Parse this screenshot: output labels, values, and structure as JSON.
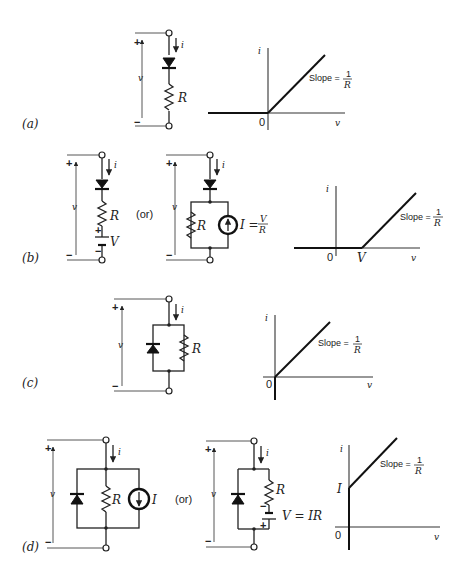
{
  "figure": {
    "panels": [
      {
        "id": "a",
        "label": "(a)",
        "circuit": {
          "current": "i",
          "voltage": "v",
          "plus": "+",
          "minus": "−",
          "resistor": "R"
        },
        "graph": {
          "y_axis": "i",
          "x_axis": "v",
          "origin": "0",
          "slope_text": "Slope =",
          "slope_num": "1",
          "slope_den": "R"
        }
      },
      {
        "id": "b",
        "label": "(b)",
        "circuit1": {
          "current": "i",
          "voltage": "v",
          "plus": "+",
          "minus": "−",
          "resistor": "R",
          "battery": "V",
          "bat_plus": "+",
          "bat_minus": "−"
        },
        "or_text": "(or)",
        "circuit2": {
          "current": "i",
          "voltage": "v",
          "plus": "+",
          "minus": "−",
          "resistor": "R",
          "source": "I =",
          "source_num": "V",
          "source_den": "R"
        },
        "graph": {
          "y_axis": "i",
          "x_axis": "v",
          "origin": "0",
          "knee": "V",
          "slope_text": "Slope =",
          "slope_num": "1",
          "slope_den": "R"
        }
      },
      {
        "id": "c",
        "label": "(c)",
        "circuit": {
          "current": "i",
          "voltage": "v",
          "plus": "+",
          "minus": "−",
          "resistor": "R"
        },
        "graph": {
          "y_axis": "i",
          "x_axis": "v",
          "origin": "0",
          "slope_text": "Slope =",
          "slope_num": "1",
          "slope_den": "R"
        }
      },
      {
        "id": "d",
        "label": "(d)",
        "circuit1": {
          "current": "i",
          "voltage": "v",
          "plus": "+",
          "minus": "−",
          "resistor": "R",
          "source": "I"
        },
        "or_text": "(or)",
        "circuit2": {
          "current": "i",
          "voltage": "v",
          "plus": "+",
          "minus": "−",
          "resistor": "R",
          "battery": "V = IR",
          "bat_plus": "+",
          "bat_minus": "−"
        },
        "graph": {
          "y_axis": "i",
          "x_axis": "v",
          "origin": "0",
          "intercept": "I",
          "slope_text": "Slope =",
          "slope_num": "1",
          "slope_den": "R"
        }
      }
    ]
  }
}
